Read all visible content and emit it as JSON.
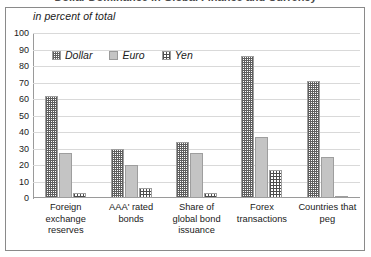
{
  "figure": {
    "title_clipped": "Dollar Dominance in Global Finance and Currency",
    "subtitle": "in percent of total"
  },
  "legend": {
    "position": "top-left-inside",
    "items": [
      {
        "label": "Dollar",
        "pattern": "dense-dotted",
        "color": "#5f5f5f"
      },
      {
        "label": "Euro",
        "pattern": "solid-light-gray",
        "color": "#c4c4c4"
      },
      {
        "label": "Yen",
        "pattern": "crosshatch-grid",
        "color": "#4d4d4d"
      }
    ]
  },
  "yaxis": {
    "ticks": [
      "100",
      "90",
      "80",
      "70",
      "60",
      "50",
      "40",
      "30",
      "20",
      "10",
      "0"
    ]
  },
  "chart_data": {
    "type": "bar",
    "title": "Dollar Dominance in Global Finance and Currency",
    "subtitle": "in percent of total",
    "xlabel": "",
    "ylabel": "",
    "ylim": [
      0,
      100
    ],
    "ytick_step": 10,
    "grid": true,
    "legend_position": "upper left",
    "categories": [
      "Foreign exchange reserves",
      "AAA' rated bonds",
      "Share of global bond issuance",
      "Forex transactions",
      "Countries that peg"
    ],
    "category_lines": [
      [
        "Foreign",
        "exchange",
        "reserves"
      ],
      [
        "AAA' rated",
        "bonds"
      ],
      [
        "Share of",
        "global bond",
        "issuance"
      ],
      [
        "Forex",
        "transactions"
      ],
      [
        "Countries that",
        "peg"
      ]
    ],
    "series": [
      {
        "name": "Dollar",
        "values": [
          62,
          30,
          34,
          86,
          71
        ]
      },
      {
        "name": "Euro",
        "values": [
          27,
          20,
          27,
          37,
          25
        ]
      },
      {
        "name": "Yen",
        "values": [
          3,
          6,
          3,
          17,
          1
        ]
      }
    ]
  }
}
